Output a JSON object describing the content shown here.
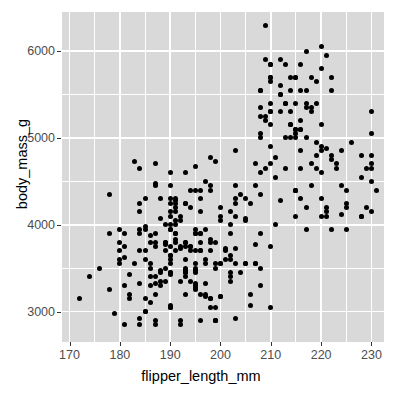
{
  "chart_data": {
    "type": "scatter",
    "title": "",
    "subtitle": "",
    "xlabel": "flipper_length_mm",
    "ylabel": "body_mass_g",
    "xlim": [
      168.5,
      232.5
    ],
    "ylim": [
      2650,
      6450
    ],
    "xticks": [
      170,
      180,
      190,
      200,
      210,
      220,
      230
    ],
    "xticklabels": [
      "170",
      "180",
      "190",
      "200",
      "210",
      "220",
      "230"
    ],
    "yticks": [
      3000,
      4000,
      5000,
      6000
    ],
    "yticklabels": [
      "3000",
      "4000",
      "5000",
      "6000"
    ],
    "x_minor_ticks": [
      175,
      185,
      195,
      205,
      215,
      225
    ],
    "y_minor_ticks": [
      2500,
      3500,
      4500,
      5500
    ],
    "grid": true,
    "grid_color": "#ffffff",
    "panel_background": "#d9d9d9",
    "page_background": "#ffffff",
    "point_color": "#000000",
    "point_size": 5,
    "legend": null,
    "n_points": 342,
    "x": [
      181,
      186,
      195,
      193,
      190,
      181,
      195,
      193,
      190,
      186,
      180,
      182,
      191,
      198,
      185,
      195,
      197,
      184,
      194,
      174,
      180,
      189,
      185,
      180,
      187,
      183,
      187,
      172,
      180,
      178,
      178,
      188,
      184,
      195,
      196,
      190,
      180,
      181,
      184,
      182,
      195,
      186,
      196,
      185,
      190,
      182,
      179,
      190,
      191,
      186,
      188,
      190,
      200,
      187,
      191,
      186,
      193,
      181,
      194,
      185,
      195,
      185,
      192,
      184,
      192,
      195,
      188,
      190,
      198,
      190,
      190,
      196,
      197,
      190,
      195,
      191,
      184,
      187,
      195,
      189,
      196,
      187,
      193,
      191,
      194,
      190,
      189,
      189,
      190,
      202,
      205,
      185,
      186,
      187,
      208,
      190,
      196,
      178,
      192,
      192,
      203,
      183,
      190,
      193,
      184,
      199,
      190,
      181,
      197,
      198,
      191,
      193,
      197,
      191,
      196,
      188,
      199,
      189,
      189,
      187,
      198,
      176,
      202,
      186,
      199,
      191,
      195,
      191,
      210,
      190,
      197,
      193,
      199,
      187,
      190,
      191,
      200,
      185,
      193,
      193,
      187,
      188,
      190,
      192,
      185,
      190,
      184,
      195,
      193,
      187,
      201,
      211,
      230,
      210,
      218,
      215,
      210,
      211,
      219,
      209,
      215,
      214,
      216,
      214,
      213,
      210,
      217,
      210,
      221,
      209,
      222,
      218,
      215,
      213,
      215,
      215,
      215,
      216,
      215,
      210,
      220,
      222,
      209,
      207,
      230,
      220,
      220,
      213,
      219,
      208,
      208,
      208,
      225,
      210,
      216,
      222,
      217,
      210,
      225,
      213,
      215,
      210,
      220,
      210,
      225,
      217,
      220,
      208,
      220,
      208,
      224,
      208,
      221,
      214,
      231,
      219,
      230,
      214,
      229,
      220,
      223,
      216,
      221,
      221,
      217,
      216,
      230,
      209,
      220,
      215,
      223,
      212,
      221,
      212,
      224,
      212,
      228,
      218,
      218,
      212,
      230,
      218,
      228,
      212,
      224,
      214,
      226,
      216,
      222,
      203,
      225,
      219,
      228,
      215,
      228,
      216,
      215,
      210,
      219,
      208,
      209,
      216,
      229,
      213,
      230,
      217,
      230,
      217,
      222,
      214,
      217,
      198,
      202,
      204,
      184,
      195,
      196,
      188,
      191,
      199,
      196,
      200,
      199,
      187,
      193,
      198,
      194,
      193,
      205,
      192,
      194,
      184,
      192,
      203,
      190,
      203,
      197,
      191,
      203,
      202,
      194,
      206,
      189,
      195,
      207,
      202,
      193,
      210,
      198,
      200,
      202,
      205,
      196,
      208,
      197,
      201,
      200,
      203,
      202,
      207,
      195,
      205,
      198,
      204,
      199,
      200,
      201,
      199,
      206,
      203,
      203,
      207,
      210,
      208,
      200,
      211,
      198,
      208,
      206,
      212,
      202,
      205,
      196,
      207
    ],
    "y": [
      3750,
      3800,
      3250,
      3450,
      3650,
      3625,
      4675,
      3475,
      4250,
      3300,
      3700,
      3200,
      3800,
      4400,
      3700,
      3450,
      4500,
      3325,
      4200,
      3400,
      3600,
      3800,
      3950,
      3800,
      3800,
      3550,
      3200,
      3150,
      3950,
      3250,
      3900,
      3300,
      3900,
      3325,
      4150,
      3950,
      3550,
      3300,
      4650,
      3150,
      3900,
      3100,
      4400,
      3000,
      4600,
      3425,
      2975,
      3450,
      4150,
      3500,
      4300,
      3450,
      4050,
      2900,
      3700,
      3550,
      3800,
      2850,
      3750,
      3150,
      4400,
      3600,
      4050,
      2850,
      3750,
      3950,
      3350,
      4100,
      3050,
      4450,
      3600,
      3900,
      3550,
      4150,
      3700,
      4250,
      3700,
      3900,
      3550,
      4000,
      3200,
      4700,
      3800,
      4200,
      3350,
      3550,
      3800,
      3500,
      3950,
      3600,
      3550,
      4300,
      3400,
      4450,
      3300,
      4300,
      3700,
      4350,
      2900,
      4100,
      3725,
      4725,
      3075,
      4250,
      2925,
      3550,
      3750,
      3900,
      3175,
      4775,
      3825,
      4600,
      3200,
      4275,
      3900,
      4075,
      2900,
      3775,
      3350,
      3325,
      3150,
      3500,
      3450,
      3875,
      3050,
      4000,
      3275,
      4300,
      3050,
      4000,
      3325,
      3500,
      3500,
      4475,
      3425,
      3900,
      3175,
      3975,
      3400,
      4250,
      3400,
      3475,
      3050,
      3725,
      3000,
      3650,
      4250,
      3475,
      3450,
      3750,
      3700,
      4000,
      4500,
      5700,
      4450,
      5700,
      5400,
      4550,
      4800,
      5200,
      4400,
      5150,
      4650,
      5550,
      4650,
      5850,
      4200,
      5850,
      4150,
      6300,
      4800,
      5350,
      5700,
      5000,
      4400,
      5050,
      5000,
      5100,
      4100,
      5650,
      4600,
      5550,
      5250,
      4700,
      5050,
      6050,
      5150,
      5400,
      4950,
      5250,
      4350,
      5350,
      3950,
      5700,
      4300,
      4750,
      5550,
      4900,
      4200,
      5400,
      5100,
      5300,
      4850,
      5300,
      4400,
      5000,
      4900,
      5050,
      4300,
      5000,
      4450,
      5550,
      4200,
      5300,
      4400,
      5650,
      4700,
      5700,
      4650,
      5800,
      4700,
      5550,
      4875,
      5950,
      5400,
      5100,
      5300,
      5900,
      4100,
      5100,
      4650,
      5500,
      4100,
      5500,
      4120,
      5900,
      4100,
      5300,
      4700,
      5600,
      4650,
      5700,
      4100,
      5300,
      4850,
      5150,
      4950,
      4850,
      3950,
      4850,
      4250,
      5400,
      4550,
      5400,
      4800,
      5200,
      4400,
      5150,
      4650,
      5550,
      4650,
      5850,
      4200,
      5850,
      4150,
      6000,
      4800,
      5350,
      5700,
      5000,
      3950,
      4450,
      3650,
      3450,
      4150,
      3500,
      4300,
      3450,
      4050,
      2900,
      3700,
      3550,
      3800,
      2850,
      3750,
      3150,
      4400,
      3600,
      4050,
      2850,
      3750,
      3950,
      3350,
      4100,
      3050,
      4450,
      3600,
      3900,
      3550,
      4150,
      3700,
      4250,
      3700,
      3900,
      3550,
      4000,
      3200,
      4700,
      3800,
      4200,
      3350,
      3550,
      3800,
      3500,
      3950,
      3600,
      3550,
      4300,
      3400,
      4450,
      3300,
      4300,
      3700,
      4350,
      2900,
      4100,
      3725,
      4725,
      3075,
      4250,
      2925,
      3550,
      3750,
      3900,
      3175,
      4775,
      3825,
      4600,
      3200,
      4275,
      3900,
      4075,
      2900,
      3775,
      3350
    ]
  }
}
